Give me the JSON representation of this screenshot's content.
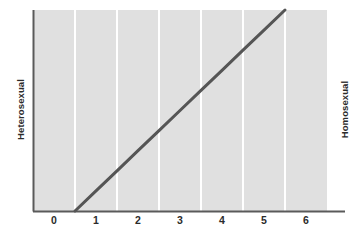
{
  "chart_data": {
    "type": "line",
    "title": "",
    "subtitle": "",
    "xlabel": "",
    "ylabel": "",
    "xlim": [
      -0.5,
      6.5
    ],
    "ylim": [
      0,
      1
    ],
    "grid": true,
    "gridlines_x": [
      0.5,
      1.5,
      2.5,
      3.5,
      4.5,
      5.5
    ],
    "legend": "none",
    "xticklabels": [
      "0",
      "1",
      "2",
      "3",
      "4",
      "5",
      "6"
    ],
    "xticks": [
      0,
      1,
      2,
      3,
      4,
      5,
      6
    ],
    "yticklabels": [],
    "yticks": [],
    "axis_endpoint_labels": {
      "left": "Heterosexual",
      "right": "Homosexual"
    },
    "series": [
      {
        "name": "Kinsey scale continuum",
        "x": [
          0.5,
          5.5
        ],
        "y": [
          0,
          1
        ],
        "points": [
          {
            "x": 0.5,
            "y": 0.0
          },
          {
            "x": 1.0,
            "y": 0.1
          },
          {
            "x": 1.5,
            "y": 0.2
          },
          {
            "x": 2.0,
            "y": 0.3
          },
          {
            "x": 2.5,
            "y": 0.4
          },
          {
            "x": 3.0,
            "y": 0.5
          },
          {
            "x": 3.5,
            "y": 0.6
          },
          {
            "x": 4.0,
            "y": 0.7
          },
          {
            "x": 4.5,
            "y": 0.8
          },
          {
            "x": 5.0,
            "y": 0.9
          },
          {
            "x": 5.5,
            "y": 1.0
          }
        ],
        "color": "#555555",
        "linewidth": 3
      }
    ],
    "colors": {
      "plot_background": "#e0e0e0",
      "gridline": "#ffffff",
      "axis": "#5a5a5a",
      "line": "#555555",
      "text": "#2b2b2b",
      "page_background": "#ffffff"
    }
  }
}
